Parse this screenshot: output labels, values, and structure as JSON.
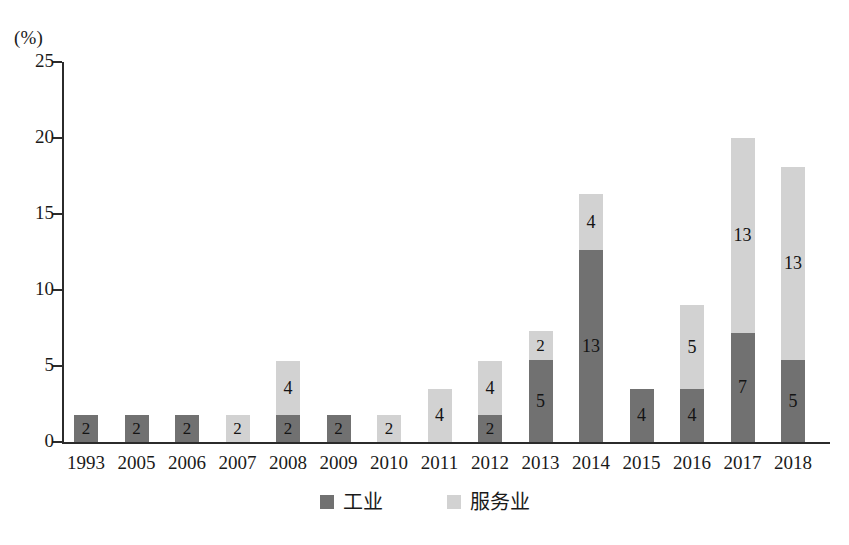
{
  "chart_data": {
    "type": "bar",
    "title": "",
    "subtitle": "",
    "xlabel": "",
    "ylabel": "",
    "unit_label": "(%)",
    "ylim": [
      0,
      25
    ],
    "yticks": [
      0,
      5,
      10,
      15,
      20,
      25
    ],
    "grid": false,
    "stacked": true,
    "legend_position": "bottom-center",
    "categories": [
      "1993",
      "2005",
      "2006",
      "2007",
      "2008",
      "2009",
      "2010",
      "2011",
      "2012",
      "2013",
      "2014",
      "2015",
      "2016",
      "2017",
      "2018"
    ],
    "series": [
      {
        "name": "工业",
        "color": "#717171",
        "values": [
          1.75,
          1.75,
          1.75,
          0,
          1.75,
          1.75,
          0,
          0,
          1.75,
          5.4,
          12.6,
          3.5,
          3.5,
          7.2,
          5.4
        ],
        "labels": [
          "2",
          "2",
          "2",
          "",
          "2",
          "2",
          "",
          "",
          "2",
          "5",
          "13",
          "4",
          "4",
          "7",
          "5"
        ]
      },
      {
        "name": "服务业",
        "color": "#d2d2d2",
        "values": [
          0,
          0,
          0,
          1.75,
          3.6,
          0,
          1.75,
          3.5,
          3.6,
          1.9,
          3.7,
          0,
          5.5,
          12.8,
          12.7
        ],
        "labels": [
          "",
          "",
          "",
          "2",
          "4",
          "",
          "2",
          "4",
          "4",
          "2",
          "4",
          "",
          "5",
          "13",
          "13"
        ]
      }
    ],
    "totals": [
      1.75,
      1.75,
      1.75,
      1.75,
      5.35,
      1.75,
      1.75,
      3.5,
      5.35,
      7.3,
      16.3,
      3.5,
      9.0,
      20.0,
      18.1
    ]
  },
  "legend": {
    "items": [
      {
        "label": "工业",
        "color": "#717171"
      },
      {
        "label": "服务业",
        "color": "#d2d2d2"
      }
    ]
  }
}
